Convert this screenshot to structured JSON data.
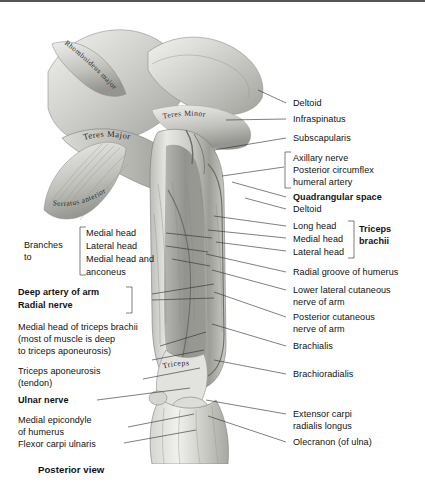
{
  "figure": {
    "caption": "Posterior view",
    "border_color": "#555555",
    "text_color": "#111111",
    "background": "#ffffff"
  },
  "illustration": {
    "style": "grayscale-anatomical-drawing",
    "region": "posterior shoulder and arm",
    "inscriptions": [
      {
        "text": "Rhomboideus major",
        "curve": "diagonal-down-right"
      },
      {
        "text": "Teres Major",
        "curve": "arc-right"
      },
      {
        "text": "Teres Minor",
        "curve": "arc-right"
      },
      {
        "text": "Serratus anterior",
        "curve": "fan-arc"
      },
      {
        "text": "Triceps",
        "curve": "slight-arc"
      }
    ]
  },
  "labels_right": [
    {
      "id": "deltoid-top",
      "text": "Deltoid",
      "bold": false
    },
    {
      "id": "infraspinatus",
      "text": "Infraspinatus",
      "bold": false
    },
    {
      "id": "subscapularis",
      "text": "Subscapularis",
      "bold": false
    },
    {
      "id": "axillary-nerve",
      "text": "Axillary nerve",
      "bold": false
    },
    {
      "id": "post-circumflex",
      "text": "Posterior circumflex",
      "bold": false
    },
    {
      "id": "humeral-artery",
      "text": "humeral artery",
      "bold": false
    },
    {
      "id": "quadrangular-space",
      "text": "Quadrangular space",
      "bold": true
    },
    {
      "id": "deltoid-second",
      "text": "Deltoid",
      "bold": false
    },
    {
      "id": "long-head",
      "text": "Long head",
      "bold": false
    },
    {
      "id": "medial-head",
      "text": "Medial head",
      "bold": false
    },
    {
      "id": "lateral-head",
      "text": "Lateral head",
      "bold": false
    },
    {
      "id": "triceps-brachii-1",
      "text": "Triceps",
      "bold": true
    },
    {
      "id": "triceps-brachii-2",
      "text": "brachii",
      "bold": true
    },
    {
      "id": "radial-groove",
      "text": "Radial groove of humerus",
      "bold": false
    },
    {
      "id": "lower-lat-cut-1",
      "text": "Lower lateral cutaneous",
      "bold": false
    },
    {
      "id": "lower-lat-cut-2",
      "text": "nerve of arm",
      "bold": false
    },
    {
      "id": "post-cut-1",
      "text": "Posterior cutaneous",
      "bold": false
    },
    {
      "id": "post-cut-2",
      "text": "nerve of arm",
      "bold": false
    },
    {
      "id": "brachialis",
      "text": "Brachialis",
      "bold": false
    },
    {
      "id": "brachioradialis",
      "text": "Brachioradialis",
      "bold": false
    },
    {
      "id": "ecrl-1",
      "text": "Extensor carpi",
      "bold": false
    },
    {
      "id": "ecrl-2",
      "text": "radialis longus",
      "bold": false
    },
    {
      "id": "olecranon",
      "text": "Olecranon (of ulna)",
      "bold": false
    }
  ],
  "labels_left": [
    {
      "id": "branches-1",
      "text": "Branches",
      "bold": false
    },
    {
      "id": "branches-2",
      "text": "to",
      "bold": false
    },
    {
      "id": "br-medial-head",
      "text": "Medial head",
      "bold": false
    },
    {
      "id": "br-lateral-head",
      "text": "Lateral head",
      "bold": false
    },
    {
      "id": "br-med-anc-1",
      "text": "Medial head and",
      "bold": false
    },
    {
      "id": "br-med-anc-2",
      "text": "anconeus",
      "bold": false
    },
    {
      "id": "deep-artery",
      "text": "Deep artery of arm",
      "bold": true
    },
    {
      "id": "radial-nerve",
      "text": "Radial nerve",
      "bold": true
    },
    {
      "id": "med-head-tb-1",
      "text": "Medial head of triceps brachii",
      "bold": false
    },
    {
      "id": "med-head-tb-2",
      "text": "(most of muscle is deep",
      "bold": false
    },
    {
      "id": "med-head-tb-3",
      "text": "to triceps aponeurosis)",
      "bold": false
    },
    {
      "id": "aponeurosis-1",
      "text": "Triceps aponeurosis",
      "bold": false
    },
    {
      "id": "aponeurosis-2",
      "text": "(tendon)",
      "bold": false
    },
    {
      "id": "ulnar-nerve",
      "text": "Ulnar nerve",
      "bold": true
    },
    {
      "id": "med-epi-1",
      "text": "Medial epicondyle",
      "bold": false
    },
    {
      "id": "med-epi-2",
      "text": "of humerus",
      "bold": false
    },
    {
      "id": "fcu",
      "text": "Flexor carpi ulnaris",
      "bold": false
    }
  ]
}
